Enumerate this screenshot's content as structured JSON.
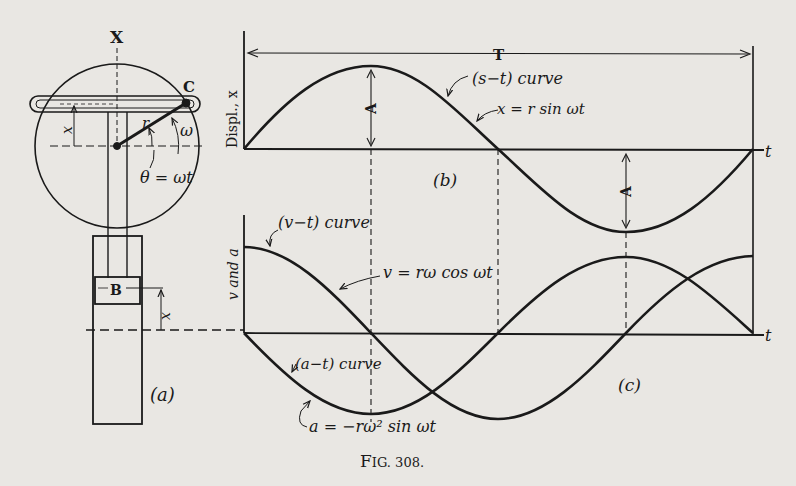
{
  "figure": {
    "caption": "Fig. 308.",
    "caption_prefix": "F",
    "caption_rest": "IG. 308."
  },
  "panel_a": {
    "label": "(a)",
    "axis_label": "X",
    "crank_pin": "C",
    "block": "B",
    "radius": "r",
    "angular_velocity": "ω",
    "angle": "θ = ωt",
    "displacement_top": "x",
    "displacement_block": "x"
  },
  "panel_b": {
    "label": "(b)",
    "ylabel": "Displ., x",
    "xlabel": "t",
    "period_label": "T",
    "amplitude_label": "A",
    "amplitude_label_2": "A",
    "curve_name": "(s−t) curve",
    "equation": "x = r sin ωt"
  },
  "panel_c": {
    "label": "(c)",
    "ylabel": "v and a",
    "xlabel": "t",
    "v_curve_name": "(v−t) curve",
    "v_equation": "v = rω cos ωt",
    "a_curve_name": "(a−t) curve",
    "a_equation": "a = −rω² sin ωt"
  },
  "colors": {
    "paper": "#e9e7e3",
    "ink": "#1a1a1a"
  }
}
